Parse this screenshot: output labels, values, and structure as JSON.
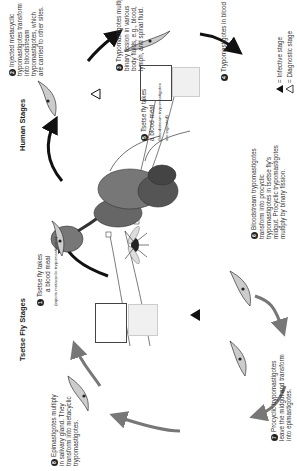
{
  "titles": {
    "tsetse": "Tsetse Fly Stages",
    "human": "Human Stages"
  },
  "steps": [
    {
      "n": "1",
      "lines": [
        "Tsetse fly takes",
        "a blood meal"
      ],
      "sub": "(injects metacyclic trypomastigotes)"
    },
    {
      "n": "2",
      "lines": [
        "Injected metacyclic",
        "trypomastigotes transform",
        "into bloodstream",
        "trypomastigotes, which",
        "are carried to other sites."
      ]
    },
    {
      "n": "3",
      "lines": [
        "Trypomastigotes multiply by",
        "binary fission in various",
        "body fluids, e.g., blood,",
        "lymph, and spinal fluid."
      ]
    },
    {
      "n": "4",
      "lines": [
        "Trypomastigotes in blood"
      ]
    },
    {
      "n": "5",
      "lines": [
        "Tsetse fly takes",
        "a blood meal"
      ],
      "sub": [
        "(bloodstream trypomastigotes",
        "are ingested)."
      ]
    },
    {
      "n": "6",
      "lines": [
        "Bloodstream trypomastigotes",
        "transform into procyclic",
        "trypomastigotes in tsetse fly's",
        "midgut. Procyclic trypomastigotes",
        "multiply by binary fission."
      ]
    },
    {
      "n": "7",
      "lines": [
        "Procyclic trypomastigotes",
        "leave the midgut and transform",
        "into epimastigotes."
      ]
    },
    {
      "n": "8",
      "lines": [
        "Epimastigotes multiply",
        "in salivary gland. They",
        "transform into metacyclic",
        "trypomastigotes."
      ]
    }
  ],
  "legend": {
    "infective": "= Infective stage",
    "diagnostic": "= Diagnostic stage",
    "infective_mark": "i",
    "diagnostic_mark": "d"
  },
  "colors": {
    "human_arrow": "#111111",
    "fly_arrow": "#777777",
    "organ_dark": "#555555",
    "organ_light": "#888888"
  }
}
